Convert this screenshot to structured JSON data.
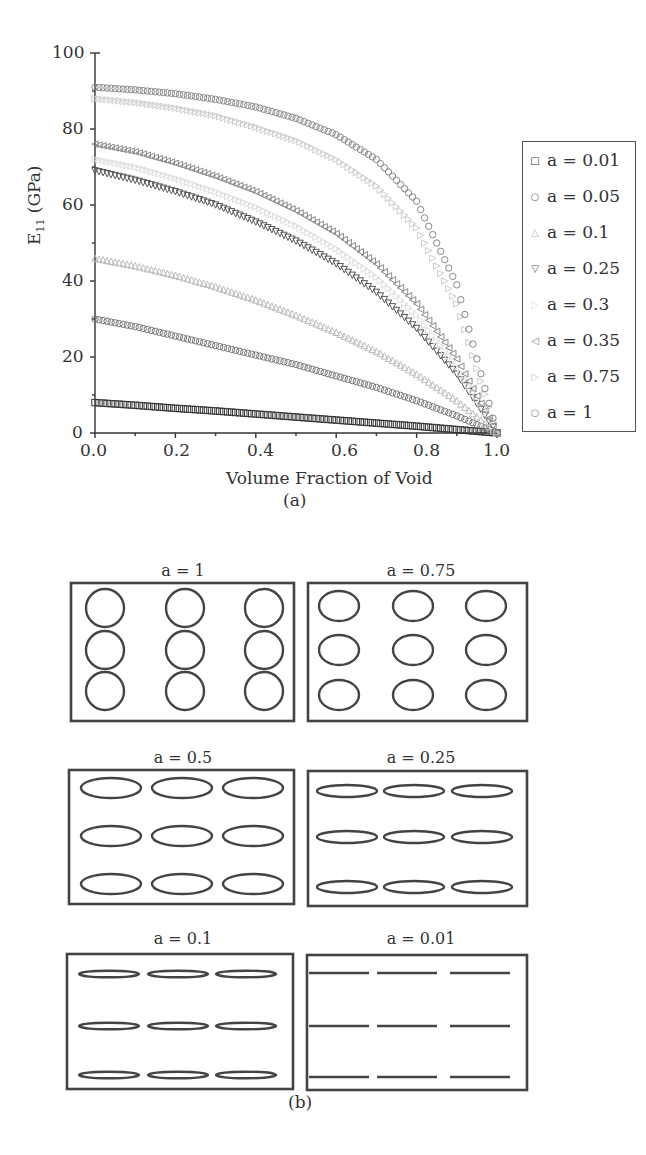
{
  "figure_a": {
    "caption": "(a)",
    "y_axis_title_main": "E",
    "y_axis_title_sub": "11",
    "y_axis_title_unit": " (GPa)",
    "x_axis_title": "Volume Fraction of Void",
    "y_ticks": [
      "100",
      "80",
      "60",
      "40",
      "20",
      "0"
    ],
    "x_ticks": [
      "0.0",
      "0.2",
      "0.4",
      "0.6",
      "0.8",
      "1.0"
    ],
    "legend": [
      {
        "label": "a = 0.01",
        "marker": "□",
        "color": "#333333"
      },
      {
        "label": "a = 0.05",
        "marker": "○",
        "color": "#777777"
      },
      {
        "label": "a = 0.1",
        "marker": "△",
        "color": "#bbbbbb"
      },
      {
        "label": "a = 0.25",
        "marker": "▽",
        "color": "#555555"
      },
      {
        "label": "a = 0.3",
        "marker": "▷",
        "color": "#dddddd"
      },
      {
        "label": "a = 0.35",
        "marker": "◁",
        "color": "#888888"
      },
      {
        "label": "a = 0.75",
        "marker": "▷",
        "color": "#cccccc"
      },
      {
        "label": "a = 1",
        "marker": "○",
        "color": "#888888"
      }
    ]
  },
  "figure_b": {
    "caption": "(b)",
    "panels": [
      {
        "title": "a = 1"
      },
      {
        "title": "a = 0.75"
      },
      {
        "title": "a = 0.5"
      },
      {
        "title": "a = 0.25"
      },
      {
        "title": "a = 0.1"
      },
      {
        "title": "a = 0.01"
      }
    ]
  },
  "chart_data": {
    "type": "scatter",
    "title": "",
    "xlabel": "Volume Fraction of Void",
    "ylabel": "E11 (GPa)",
    "xlim": [
      0.0,
      1.0
    ],
    "ylim": [
      0,
      100
    ],
    "grid": false,
    "legend_position": "right, outside",
    "x": [
      0.0,
      0.1,
      0.2,
      0.3,
      0.4,
      0.5,
      0.6,
      0.7,
      0.8,
      0.9,
      1.0
    ],
    "series": [
      {
        "name": "a = 0.01",
        "marker": "square",
        "values": [
          8,
          7.3,
          6.5,
          5.8,
          5.0,
          4.2,
          3.4,
          2.6,
          1.8,
          0.9,
          0
        ]
      },
      {
        "name": "a = 0.05",
        "marker": "circle",
        "values": [
          30,
          28,
          25.5,
          23,
          20.5,
          18,
          15,
          12,
          8.5,
          4.5,
          0
        ]
      },
      {
        "name": "a = 0.1",
        "marker": "triangle-up",
        "values": [
          46,
          44,
          41.5,
          38.5,
          35,
          31,
          26.5,
          21.5,
          15.5,
          8.5,
          0
        ]
      },
      {
        "name": "a = 0.25",
        "marker": "triangle-down",
        "values": [
          69,
          66.5,
          63.5,
          60,
          55.5,
          50.5,
          44.5,
          37,
          27.5,
          15.5,
          0
        ]
      },
      {
        "name": "a = 0.3",
        "marker": "triangle-right",
        "values": [
          72,
          70,
          67,
          63.5,
          59.5,
          54.5,
          48.5,
          41,
          31,
          17.5,
          0
        ]
      },
      {
        "name": "a = 0.35",
        "marker": "triangle-left",
        "values": [
          76,
          74,
          71,
          67.5,
          63.5,
          58.5,
          52.5,
          44.5,
          34,
          19.5,
          0
        ]
      },
      {
        "name": "a = 0.75",
        "marker": "triangle-right",
        "values": [
          88,
          87,
          85.5,
          83.5,
          80.5,
          77,
          72,
          65,
          54,
          34,
          0
        ]
      },
      {
        "name": "a = 1",
        "marker": "circle",
        "values": [
          91,
          90.3,
          89.3,
          87.8,
          85.8,
          82.8,
          78.5,
          72,
          61,
          39,
          0
        ]
      }
    ]
  }
}
